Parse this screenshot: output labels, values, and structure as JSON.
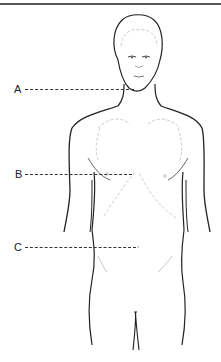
{
  "diagram": {
    "type": "anatomical-figure",
    "colors": {
      "outline": "#222222",
      "inner_detail": "#b8b8b8",
      "leader_line": "#333333",
      "top_rule": "#555555"
    },
    "labels": [
      {
        "id": "A",
        "text": "A",
        "x": 14,
        "y": 84,
        "line_x1": 25,
        "line_x2": 134,
        "line_y": 89,
        "target": "neck / chin region"
      },
      {
        "id": "B",
        "text": "B",
        "x": 15,
        "y": 169,
        "line_x1": 25,
        "line_x2": 132,
        "line_y": 174,
        "target": "chest / sternum region"
      },
      {
        "id": "C",
        "text": "C",
        "x": 14,
        "y": 242,
        "line_x1": 25,
        "line_x2": 136,
        "line_y": 247,
        "target": "abdomen / navel region"
      }
    ]
  }
}
